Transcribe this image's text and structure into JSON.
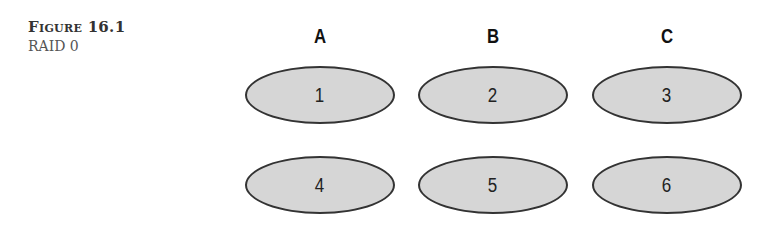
{
  "caption": {
    "label": "Figure 16.1",
    "title": "RAID 0"
  },
  "columns": [
    {
      "label": "A"
    },
    {
      "label": "B"
    },
    {
      "label": "C"
    }
  ],
  "blocks": [
    {
      "label": "1",
      "column": "A",
      "row": 1
    },
    {
      "label": "2",
      "column": "B",
      "row": 1
    },
    {
      "label": "3",
      "column": "C",
      "row": 1
    },
    {
      "label": "4",
      "column": "A",
      "row": 2
    },
    {
      "label": "5",
      "column": "B",
      "row": 2
    },
    {
      "label": "6",
      "column": "C",
      "row": 2
    }
  ],
  "colors": {
    "disk_fill": "#d6d6d6",
    "disk_stroke": "#333333"
  }
}
